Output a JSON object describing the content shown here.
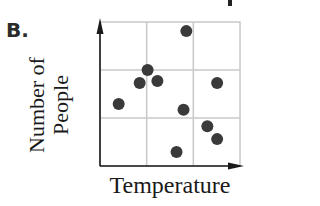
{
  "choice": {
    "label": "B."
  },
  "chart_data": {
    "type": "scatter",
    "title": "",
    "xlabel": "Temperature",
    "ylabel_lines": [
      "Number of",
      "People"
    ],
    "ylabel": "Number of People",
    "grid": true,
    "grid_divisions": {
      "x": 3,
      "y": 3
    },
    "xlim": [
      0,
      3
    ],
    "ylim": [
      0,
      3
    ],
    "tick_labels": {
      "x": [],
      "y": []
    },
    "axes_arrows": true,
    "point_color": "#3a3a3a",
    "grid_color": "#c8c8c8",
    "points": [
      {
        "x": 1.85,
        "y": 2.81
      },
      {
        "x": 1.02,
        "y": 2.0
      },
      {
        "x": 0.85,
        "y": 1.73
      },
      {
        "x": 1.23,
        "y": 1.77
      },
      {
        "x": 2.51,
        "y": 1.73
      },
      {
        "x": 0.4,
        "y": 1.29
      },
      {
        "x": 1.79,
        "y": 1.17
      },
      {
        "x": 2.3,
        "y": 0.83
      },
      {
        "x": 2.51,
        "y": 0.56
      },
      {
        "x": 1.64,
        "y": 0.29
      }
    ]
  }
}
